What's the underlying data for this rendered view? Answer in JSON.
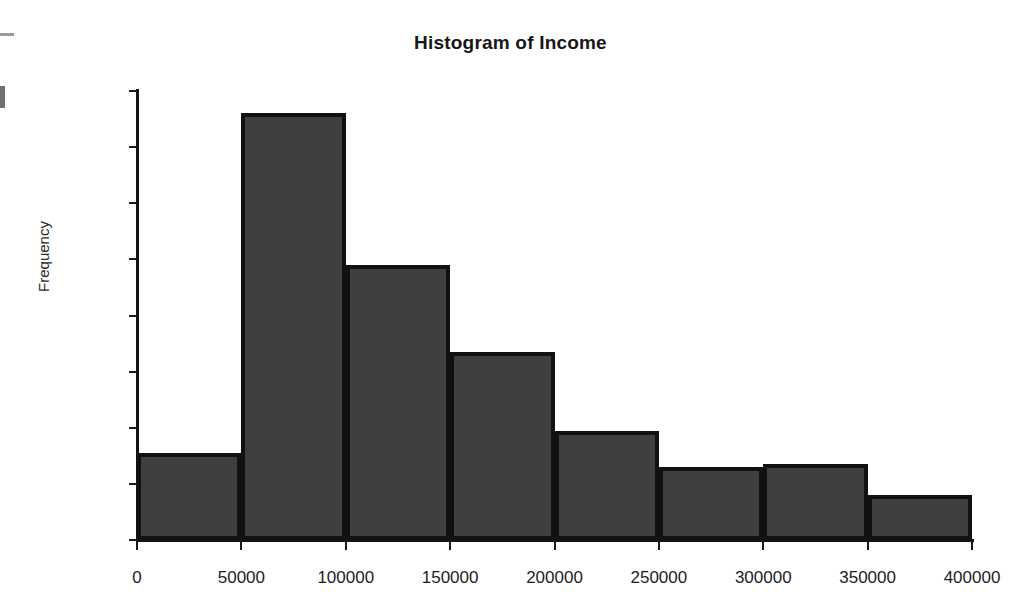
{
  "chart_data": {
    "type": "bar",
    "title": "Histogram of Income",
    "xlabel": "",
    "ylabel": "Frequency",
    "categories": [
      "0-50000",
      "50000-100000",
      "100000-150000",
      "150000-200000",
      "200000-250000",
      "250000-300000",
      "300000-350000",
      "350000-400000"
    ],
    "bin_edges": [
      0,
      50000,
      100000,
      150000,
      200000,
      250000,
      300000,
      350000,
      400000
    ],
    "values": [
      31,
      152,
      98,
      67,
      39,
      26,
      27,
      16
    ],
    "xlim": [
      0,
      400000
    ],
    "ylim": [
      0,
      160
    ],
    "x_ticks": [
      "0",
      "50000",
      "100000",
      "150000",
      "200000",
      "250000",
      "300000",
      "350000",
      "400000"
    ],
    "x_tick_values": [
      0,
      50000,
      100000,
      150000,
      200000,
      250000,
      300000,
      350000,
      400000
    ],
    "y_ticks": [
      "0",
      "20",
      "40",
      "60",
      "80",
      "100",
      "120",
      "140",
      "160"
    ],
    "y_tick_values": [
      0,
      20,
      40,
      60,
      80,
      100,
      120,
      140,
      160
    ],
    "grid": false,
    "legend": false,
    "bar_fill_color": "#3f3f3f",
    "bar_border_color": "#111111",
    "axis_color": "#141414",
    "background_color": "#ffffff"
  }
}
